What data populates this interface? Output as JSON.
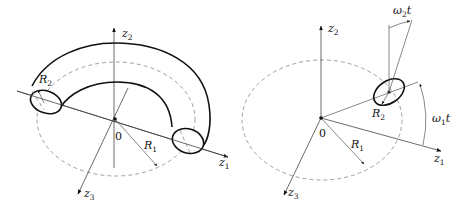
{
  "left_figure": {
    "axes": {
      "z1": {
        "base": "z",
        "sub": "1"
      },
      "z2": {
        "base": "z",
        "sub": "2"
      },
      "z3": {
        "base": "z",
        "sub": "3"
      }
    },
    "origin_label": "0",
    "radius_major": {
      "base": "R",
      "sub": "1"
    },
    "radius_minor": {
      "base": "R",
      "sub": "2"
    }
  },
  "right_figure": {
    "axes": {
      "z1": {
        "base": "z",
        "sub": "1"
      },
      "z2": {
        "base": "z",
        "sub": "2"
      },
      "z3": {
        "base": "z",
        "sub": "3"
      }
    },
    "origin_label": "0",
    "radius_major": {
      "base": "R",
      "sub": "1"
    },
    "radius_minor": {
      "base": "R",
      "sub": "2"
    },
    "angle_major": {
      "base": "ω",
      "sub": "1",
      "suffix": "t"
    },
    "angle_minor": {
      "base": "ω",
      "sub": "2",
      "suffix": "t"
    }
  },
  "colors": {
    "stroke": "#111111",
    "axis": "#444444",
    "dashed": "#888888",
    "background": "#ffffff"
  }
}
